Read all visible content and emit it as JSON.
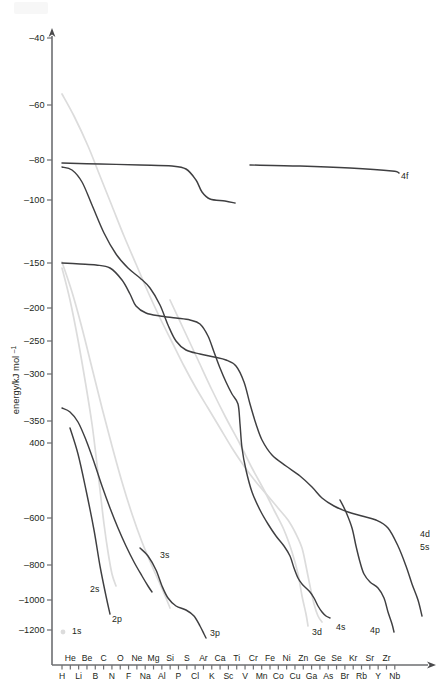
{
  "chart_data": {
    "type": "line",
    "title": "",
    "xlabel": "",
    "ylabel": "energy/kJ mol",
    "ylabel_sup": "-1",
    "grid": false,
    "legend": "inline-curve-labels",
    "y_scale": "logarithmic (negative energy)",
    "ylim": [
      -1300,
      -35
    ],
    "y_ticks": [
      "-40",
      "-60",
      "-80",
      "-100",
      "-150",
      "-200",
      "-250",
      "-300",
      "-350",
      "400",
      "-600",
      "-800",
      "-1000",
      "-1200"
    ],
    "y_tick_values": [
      -40,
      -60,
      -80,
      -100,
      -150,
      -200,
      -250,
      -300,
      -350,
      -400,
      -600,
      -800,
      -1000,
      -1200
    ],
    "x_labels_top": [
      "He",
      "Be",
      "C",
      "O",
      "Ne",
      "Mg",
      "Si",
      "S",
      "Ar",
      "Ca",
      "Ti",
      "Cr",
      "Fe",
      "Ni",
      "Zn",
      "Ge",
      "Se",
      "Kr",
      "Sr",
      "Zr"
    ],
    "x_labels_bottom": [
      "H",
      "Li",
      "B",
      "N",
      "F",
      "Na",
      "Al",
      "P",
      "Cl",
      "K",
      "Sc",
      "V",
      "Mn",
      "Co",
      "Cu",
      "Ga",
      "As",
      "Br",
      "Rb",
      "Y",
      "Nb"
    ],
    "x_categories": [
      "H",
      "He",
      "Li",
      "Be",
      "B",
      "C",
      "N",
      "O",
      "F",
      "Ne",
      "Na",
      "Mg",
      "Al",
      "Si",
      "P",
      "S",
      "Cl",
      "Ar",
      "K",
      "Ca",
      "Sc",
      "Ti",
      "V",
      "Cr",
      "Mn",
      "Fe",
      "Co",
      "Ni",
      "Cu",
      "Zn",
      "Ga",
      "Ge",
      "As",
      "Se",
      "Br",
      "Kr",
      "Rb",
      "Sr",
      "Y",
      "Zr",
      "Nb"
    ],
    "series": [
      {
        "name": "4f",
        "label": "4f",
        "color": "#3f3f41",
        "style": "dark",
        "label_x": 401,
        "label_y": 179,
        "segments": [
          [
            [
              62,
              163
            ],
            [
              100,
              164
            ],
            [
              140,
              165
            ],
            [
              172,
              166
            ],
            [
              186,
              169
            ],
            [
              196,
              180
            ],
            [
              202,
              192
            ],
            [
              210,
              199
            ],
            [
              225,
              201
            ],
            [
              235,
              203
            ]
          ],
          [
            [
              250,
              165
            ],
            [
              300,
              166
            ],
            [
              350,
              168
            ],
            [
              392,
              171
            ],
            [
              399,
              173
            ]
          ]
        ]
      },
      {
        "name": "4d-5s",
        "label": "4d",
        "label2": "5s",
        "color": "#3f3f41",
        "style": "dark",
        "label_x": 420,
        "label_y": 537,
        "label2_x": 420,
        "label2_y": 550,
        "segments": [
          [
            [
              62,
              167
            ],
            [
              72,
              170
            ],
            [
              82,
              182
            ],
            [
              92,
              205
            ],
            [
              104,
              233
            ],
            [
              116,
              254
            ],
            [
              128,
              268
            ],
            [
              140,
              278
            ],
            [
              150,
              288
            ],
            [
              160,
              305
            ],
            [
              168,
              325
            ],
            [
              176,
              341
            ],
            [
              186,
              350
            ],
            [
              200,
              354
            ],
            [
              214,
              357
            ],
            [
              226,
              360
            ],
            [
              236,
              366
            ],
            [
              244,
              382
            ],
            [
              250,
              404
            ],
            [
              256,
              424
            ],
            [
              262,
              440
            ],
            [
              272,
              455
            ],
            [
              286,
              466
            ],
            [
              300,
              476
            ],
            [
              312,
              487
            ],
            [
              322,
              498
            ],
            [
              334,
              506
            ],
            [
              348,
              512
            ],
            [
              362,
              516
            ],
            [
              376,
              520
            ],
            [
              388,
              528
            ],
            [
              398,
              546
            ],
            [
              406,
              566
            ],
            [
              412,
              584
            ],
            [
              418,
              600
            ],
            [
              422,
              616
            ]
          ]
        ]
      },
      {
        "name": "3d",
        "label": "3d",
        "color": "#3f3f41",
        "style": "dark",
        "label_x": 312,
        "label_y": 635,
        "segments": [
          [
            [
              62,
              263
            ],
            [
              80,
              264
            ],
            [
              96,
              265
            ],
            [
              110,
              268
            ],
            [
              122,
              280
            ],
            [
              130,
              294
            ],
            [
              136,
              306
            ],
            [
              146,
              313
            ],
            [
              160,
              316
            ],
            [
              176,
              318
            ],
            [
              190,
              320
            ],
            [
              200,
              324
            ],
            [
              208,
              336
            ],
            [
              214,
              352
            ],
            [
              220,
              368
            ],
            [
              226,
              382
            ],
            [
              232,
              394
            ],
            [
              238,
              404
            ],
            [
              240,
              424
            ],
            [
              242,
              448
            ],
            [
              246,
              470
            ],
            [
              252,
              492
            ],
            [
              260,
              510
            ],
            [
              268,
              524
            ],
            [
              276,
              536
            ],
            [
              284,
              546
            ],
            [
              290,
              556
            ],
            [
              294,
              568
            ],
            [
              298,
              578
            ],
            [
              302,
              584
            ],
            [
              306,
              588
            ],
            [
              310,
              592
            ],
            [
              314,
              598
            ],
            [
              318,
              606
            ],
            [
              322,
              612
            ],
            [
              326,
              616
            ],
            [
              330,
              618
            ]
          ]
        ]
      },
      {
        "name": "3s",
        "label": "3s",
        "color": "#3f3f41",
        "style": "dark",
        "label_x": 160,
        "label_y": 558,
        "segments": [
          [
            [
              62,
              408
            ],
            [
              70,
              412
            ],
            [
              78,
              422
            ],
            [
              86,
              440
            ],
            [
              94,
              462
            ],
            [
              102,
              486
            ],
            [
              110,
              508
            ],
            [
              118,
              528
            ],
            [
              126,
              546
            ],
            [
              134,
              562
            ],
            [
              142,
              576
            ],
            [
              148,
              586
            ],
            [
              152,
              592
            ]
          ]
        ]
      },
      {
        "name": "3p",
        "label": "3p",
        "color": "#3f3f41",
        "style": "dark",
        "label_x": 210,
        "label_y": 636,
        "segments": [
          [
            [
              140,
              548
            ],
            [
              148,
              556
            ],
            [
              156,
              570
            ],
            [
              162,
              586
            ],
            [
              168,
              598
            ],
            [
              176,
              606
            ],
            [
              186,
              610
            ],
            [
              194,
              616
            ],
            [
              200,
              626
            ],
            [
              204,
              634
            ],
            [
              206,
              638
            ]
          ]
        ]
      },
      {
        "name": "4p",
        "label": "4p",
        "color": "#3f3f41",
        "style": "dark",
        "label_x": 370,
        "label_y": 633,
        "segments": [
          [
            [
              340,
              500
            ],
            [
              346,
              512
            ],
            [
              352,
              528
            ],
            [
              356,
              546
            ],
            [
              360,
              562
            ],
            [
              364,
              574
            ],
            [
              370,
              582
            ],
            [
              378,
              588
            ],
            [
              384,
              598
            ],
            [
              388,
              612
            ],
            [
              392,
              624
            ],
            [
              394,
              632
            ]
          ]
        ]
      },
      {
        "name": "2p",
        "label": "2p",
        "color": "#3f3f41",
        "style": "dark",
        "label_x": 112,
        "label_y": 622,
        "segments": [
          [
            [
              70,
              428
            ],
            [
              78,
              454
            ],
            [
              86,
              490
            ],
            [
              94,
              530
            ],
            [
              100,
              566
            ],
            [
              106,
              596
            ],
            [
              110,
              614
            ]
          ]
        ]
      },
      {
        "name": "2s",
        "label": "2s",
        "color": "#dcdcdc",
        "style": "light",
        "label_x": 90,
        "label_y": 592,
        "segments": [
          [
            [
              62,
              268
            ],
            [
              70,
              300
            ],
            [
              78,
              340
            ],
            [
              86,
              386
            ],
            [
              92,
              424
            ],
            [
              96,
              456
            ],
            [
              100,
              490
            ],
            [
              104,
              524
            ],
            [
              108,
              552
            ],
            [
              112,
              574
            ],
            [
              116,
              586
            ]
          ]
        ]
      },
      {
        "name": "1s",
        "label": "1s",
        "color": "#dcdcdc",
        "style": "light",
        "marker": true,
        "marker_x": 63,
        "marker_y": 632,
        "label_x": 72,
        "label_y": 634,
        "segments": []
      },
      {
        "name": "4s",
        "label": "4s",
        "color": "#dcdcdc",
        "style": "light",
        "label_x": 336,
        "label_y": 630,
        "segments": [
          [
            [
              62,
              94
            ],
            [
              74,
              116
            ],
            [
              88,
              146
            ],
            [
              100,
              176
            ],
            [
              112,
              206
            ],
            [
              124,
              236
            ],
            [
              136,
              264
            ],
            [
              148,
              292
            ],
            [
              160,
              318
            ],
            [
              172,
              342
            ],
            [
              184,
              366
            ],
            [
              196,
              388
            ],
            [
              208,
              408
            ],
            [
              220,
              428
            ],
            [
              232,
              448
            ],
            [
              244,
              466
            ],
            [
              256,
              482
            ],
            [
              268,
              496
            ],
            [
              278,
              508
            ],
            [
              288,
              520
            ],
            [
              296,
              534
            ],
            [
              302,
              548
            ],
            [
              306,
              566
            ],
            [
              310,
              586
            ],
            [
              314,
              604
            ],
            [
              318,
              616
            ],
            [
              322,
              622
            ]
          ]
        ]
      },
      {
        "name": "light-aux-1",
        "label": "",
        "color": "#dcdcdc",
        "style": "light",
        "segments": [
          [
            [
              62,
              262
            ],
            [
              72,
              292
            ],
            [
              82,
              328
            ],
            [
              92,
              368
            ],
            [
              102,
              408
            ],
            [
              112,
              446
            ],
            [
              122,
              482
            ],
            [
              132,
              514
            ],
            [
              142,
              542
            ],
            [
              152,
              566
            ],
            [
              160,
              584
            ],
            [
              166,
              598
            ],
            [
              170,
              608
            ]
          ]
        ]
      },
      {
        "name": "light-aux-2",
        "label": "",
        "color": "#dcdcdc",
        "style": "light",
        "segments": [
          [
            [
              170,
              300
            ],
            [
              184,
              330
            ],
            [
              198,
              360
            ],
            [
              212,
              390
            ],
            [
              226,
              418
            ],
            [
              240,
              444
            ],
            [
              252,
              468
            ],
            [
              264,
              490
            ],
            [
              274,
              510
            ],
            [
              284,
              530
            ],
            [
              292,
              552
            ],
            [
              298,
              574
            ],
            [
              302,
              596
            ],
            [
              306,
              614
            ],
            [
              308,
              626
            ]
          ]
        ]
      }
    ],
    "annotations": [
      {
        "text": "4f",
        "x": 401,
        "y": 179
      },
      {
        "text": "4d",
        "x": 420,
        "y": 537
      },
      {
        "text": "5s",
        "x": 420,
        "y": 550
      },
      {
        "text": "3s",
        "x": 160,
        "y": 558
      },
      {
        "text": "3p",
        "x": 210,
        "y": 636
      },
      {
        "text": "3d",
        "x": 312,
        "y": 635
      },
      {
        "text": "4s",
        "x": 336,
        "y": 630
      },
      {
        "text": "4p",
        "x": 370,
        "y": 633
      },
      {
        "text": "2s",
        "x": 90,
        "y": 592
      },
      {
        "text": "2p",
        "x": 112,
        "y": 622
      },
      {
        "text": "1s",
        "x": 72,
        "y": 634
      }
    ]
  },
  "axes": {
    "y_axis_x": 52,
    "y_axis_top": 30,
    "y_axis_bottom": 665,
    "x_axis_y": 665,
    "x_axis_left": 52,
    "x_axis_right": 434,
    "x_first_tick": 62,
    "x_tick_spacing": 8.32,
    "y_tick_positions": [
      38,
      105,
      160,
      200,
      263,
      308,
      341,
      374,
      421,
      443,
      518,
      565,
      600,
      630
    ]
  },
  "colors": {
    "dark_curve": "#3f3f41",
    "light_curve": "#dcdcdc",
    "axis": "#6d6e71",
    "text": "#231f20",
    "background": "#ffffff"
  }
}
